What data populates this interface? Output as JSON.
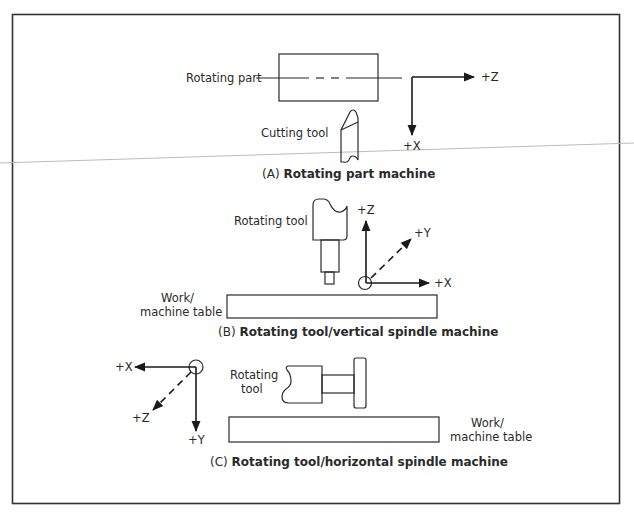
{
  "figure": {
    "border_color": "#333333",
    "scan_line_color": "#bbbbbb",
    "panels": [
      {
        "id": "A",
        "caption_prefix": "(A)",
        "caption": "Rotating part machine",
        "labels": {
          "part": "Rotating part",
          "tool": "Cutting tool"
        },
        "axes": {
          "z": "+Z",
          "x": "+X"
        }
      },
      {
        "id": "B",
        "caption_prefix": "(B)",
        "caption": "Rotating tool/vertical spindle machine",
        "labels": {
          "tool": "Rotating tool",
          "table_line1": "Work/",
          "table_line2": "machine table"
        },
        "axes": {
          "z": "+Z",
          "y": "+Y",
          "x": "+X"
        }
      },
      {
        "id": "C",
        "caption_prefix": "(C)",
        "caption": "Rotating tool/horizontal spindle machine",
        "labels": {
          "tool_line1": "Rotating",
          "tool_line2": "tool",
          "table_line1": "Work/",
          "table_line2": "machine table"
        },
        "axes": {
          "x": "+X",
          "z": "+Z",
          "y": "+Y"
        }
      }
    ]
  }
}
